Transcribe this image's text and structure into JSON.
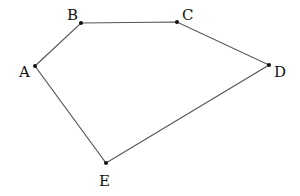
{
  "diagram": {
    "type": "pentagon",
    "stroke_color": "#555555",
    "point_color": "#111111",
    "vertices": [
      {
        "label": "A",
        "x": 35,
        "y": 66,
        "lx": 19,
        "ly": 77
      },
      {
        "label": "B",
        "x": 81,
        "y": 23,
        "lx": 67,
        "ly": 20
      },
      {
        "label": "C",
        "x": 177,
        "y": 22,
        "lx": 182,
        "ly": 20
      },
      {
        "label": "D",
        "x": 269,
        "y": 65,
        "lx": 274,
        "ly": 77
      },
      {
        "label": "E",
        "x": 106,
        "y": 163,
        "lx": 99,
        "ly": 186
      }
    ]
  }
}
